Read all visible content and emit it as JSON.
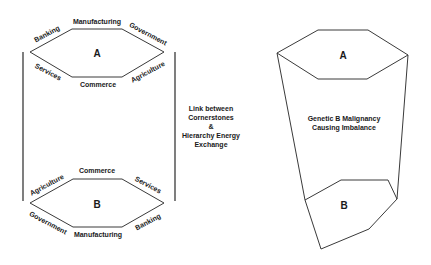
{
  "left_diagram": {
    "hexagon_a": {
      "label": "A",
      "sides": {
        "top": "Manufacturing",
        "top_left": "Banking",
        "top_right": "Government",
        "bottom_left": "Services",
        "bottom": "Commerce",
        "bottom_right": "Agriculture"
      }
    },
    "hexagon_b": {
      "label": "B",
      "sides": {
        "top": "Commerce",
        "top_left": "Agriculture",
        "top_right": "Services",
        "bottom_left": "Government",
        "bottom": "Manufacturing",
        "bottom_right": "Banking"
      }
    }
  },
  "link_text": {
    "line1": "Link between",
    "line2": "Cornerstones",
    "line3": "&",
    "line4": "Hierarchy Energy",
    "line5": "Exchange"
  },
  "right_diagram": {
    "hexagon_a": {
      "label": "A"
    },
    "shape_b": {
      "label": "B"
    },
    "caption": {
      "line1": "Genetic B Malignancy",
      "line2": "Causing Imbalance"
    }
  },
  "colors": {
    "line": "#3a3a3a",
    "text": "#1a1a1a",
    "background": "#ffffff"
  }
}
